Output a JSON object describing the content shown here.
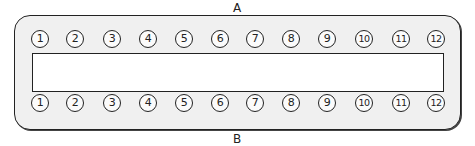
{
  "diagram": {
    "top_label": "A",
    "bottom_label": "B",
    "top_row": {
      "pins": [
        "1",
        "2",
        "3",
        "4",
        "5",
        "6",
        "7",
        "8",
        "9",
        "10",
        "11",
        "12"
      ]
    },
    "bottom_row": {
      "pins": [
        "1",
        "2",
        "3",
        "4",
        "5",
        "6",
        "7",
        "8",
        "9",
        "10",
        "11",
        "12"
      ]
    },
    "colors": {
      "frame_fill": "#f0f0f0",
      "stroke": "#222222",
      "slot_fill": "#ffffff"
    }
  }
}
